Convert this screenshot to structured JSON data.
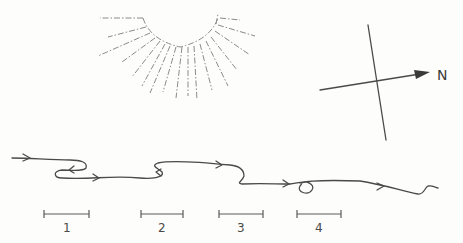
{
  "diagram": {
    "compass": {
      "label": "N"
    },
    "scale_bars": [
      {
        "label": "1"
      },
      {
        "label": "2"
      },
      {
        "label": "3"
      },
      {
        "label": "4"
      }
    ],
    "colors": {
      "ink": "#4a4a48",
      "rays": "#8a8a86",
      "background": "#fdfdfb"
    }
  }
}
